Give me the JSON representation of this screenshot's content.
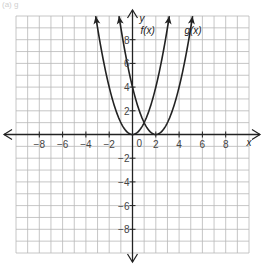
{
  "caption": "(a)           g",
  "chart_data": {
    "type": "line",
    "title": "",
    "xlabel": "x",
    "ylabel": "y",
    "xlim": [
      -10,
      10
    ],
    "ylim": [
      -10,
      10
    ],
    "grid": true,
    "x_ticks": [
      -8,
      -6,
      -4,
      -2,
      0,
      2,
      4,
      6,
      8
    ],
    "y_ticks": [
      -8,
      -6,
      -4,
      -2,
      2,
      4,
      6,
      8
    ],
    "x_tick_labels": [
      "−8",
      "−6",
      "−4",
      "−2",
      "0",
      "2",
      "4",
      "6",
      "8"
    ],
    "y_tick_labels": [
      "−8",
      "−6",
      "−4",
      "−2",
      "2",
      "4",
      "6",
      "8"
    ],
    "series": [
      {
        "name": "f(x)",
        "equation": "x^2",
        "vertex": [
          0,
          0
        ],
        "x": [
          -3.16,
          -3,
          -2,
          -1,
          0,
          1,
          2,
          3,
          3.16
        ],
        "y": [
          10,
          9,
          4,
          1,
          0,
          1,
          4,
          9,
          10
        ]
      },
      {
        "name": "g(x)",
        "equation": "(x-2)^2",
        "vertex": [
          2,
          0
        ],
        "x": [
          -1.16,
          -1,
          0,
          1,
          2,
          3,
          4,
          5,
          5.16
        ],
        "y": [
          10,
          9,
          4,
          1,
          0,
          1,
          4,
          9,
          10
        ]
      }
    ],
    "annotations": [
      {
        "text": "f(x)",
        "x": 1.3,
        "y": 8.5
      },
      {
        "text": "g(x)",
        "x": 5.2,
        "y": 8.5
      }
    ]
  },
  "labels": {
    "x_axis": "x",
    "y_axis": "y",
    "f": "f(x)",
    "g": "g(x)",
    "origin": "0"
  }
}
